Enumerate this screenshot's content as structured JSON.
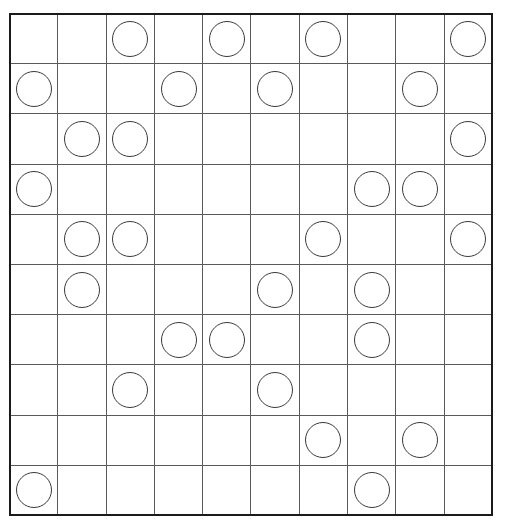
{
  "puzzle": {
    "title": "Circle Placement Grid Puzzle",
    "grid": {
      "rows": 10,
      "columns": 10,
      "cell_width_px": 48.4,
      "cell_height_px": 50.3,
      "origin_x_px": 9,
      "origin_y_px": 13,
      "width_px": 484,
      "height_px": 503
    },
    "style": {
      "background_color": "#ffffff",
      "outer_border_color": "#1b1b1b",
      "inner_line_color": "#5a5a5a",
      "circle_stroke_color": "#3a3a3a",
      "circle_fill_color": "#ffffff",
      "circle_diameter_px": 36
    },
    "legend": {
      "filled_symbol": "circle",
      "empty_symbol": "blank"
    },
    "counts": {
      "total_cells": 100,
      "circles": 30,
      "empty_cells": 70
    },
    "row_labels": [
      "1",
      "2",
      "3",
      "4",
      "5",
      "6",
      "7",
      "8",
      "9",
      "10"
    ],
    "column_labels": [
      "1",
      "2",
      "3",
      "4",
      "5",
      "6",
      "7",
      "8",
      "9",
      "10"
    ],
    "circles_per_row": [
      4,
      4,
      3,
      3,
      4,
      3,
      3,
      2,
      2,
      2
    ],
    "circles_per_column": [
      4,
      4,
      3,
      2,
      2,
      3,
      3,
      4,
      3,
      3
    ],
    "circle_positions": [
      {
        "row": 1,
        "col": 3
      },
      {
        "row": 1,
        "col": 5
      },
      {
        "row": 1,
        "col": 7
      },
      {
        "row": 1,
        "col": 10
      },
      {
        "row": 2,
        "col": 1
      },
      {
        "row": 2,
        "col": 4
      },
      {
        "row": 2,
        "col": 6
      },
      {
        "row": 2,
        "col": 9
      },
      {
        "row": 3,
        "col": 2
      },
      {
        "row": 3,
        "col": 3
      },
      {
        "row": 3,
        "col": 10
      },
      {
        "row": 4,
        "col": 1
      },
      {
        "row": 4,
        "col": 8
      },
      {
        "row": 4,
        "col": 9
      },
      {
        "row": 5,
        "col": 2
      },
      {
        "row": 5,
        "col": 3
      },
      {
        "row": 5,
        "col": 7
      },
      {
        "row": 5,
        "col": 10
      },
      {
        "row": 6,
        "col": 2
      },
      {
        "row": 6,
        "col": 6
      },
      {
        "row": 6,
        "col": 8
      },
      {
        "row": 7,
        "col": 4
      },
      {
        "row": 7,
        "col": 5
      },
      {
        "row": 7,
        "col": 8
      },
      {
        "row": 8,
        "col": 3
      },
      {
        "row": 8,
        "col": 6
      },
      {
        "row": 9,
        "col": 7
      },
      {
        "row": 9,
        "col": 9
      },
      {
        "row": 10,
        "col": 1
      },
      {
        "row": 10,
        "col": 8
      }
    ],
    "matrix": [
      [
        0,
        0,
        1,
        0,
        1,
        0,
        1,
        0,
        0,
        1
      ],
      [
        1,
        0,
        0,
        1,
        0,
        1,
        0,
        0,
        1,
        0
      ],
      [
        0,
        1,
        1,
        0,
        0,
        0,
        0,
        0,
        0,
        1
      ],
      [
        1,
        0,
        0,
        0,
        0,
        0,
        0,
        1,
        1,
        0
      ],
      [
        0,
        1,
        1,
        0,
        0,
        0,
        1,
        0,
        0,
        1
      ],
      [
        0,
        1,
        0,
        0,
        0,
        1,
        0,
        1,
        0,
        0
      ],
      [
        0,
        0,
        0,
        1,
        1,
        0,
        0,
        1,
        0,
        0
      ],
      [
        0,
        0,
        1,
        0,
        0,
        1,
        0,
        0,
        0,
        0
      ],
      [
        0,
        0,
        0,
        0,
        0,
        0,
        1,
        0,
        1,
        0
      ],
      [
        1,
        0,
        0,
        0,
        0,
        0,
        0,
        1,
        0,
        0
      ]
    ]
  }
}
